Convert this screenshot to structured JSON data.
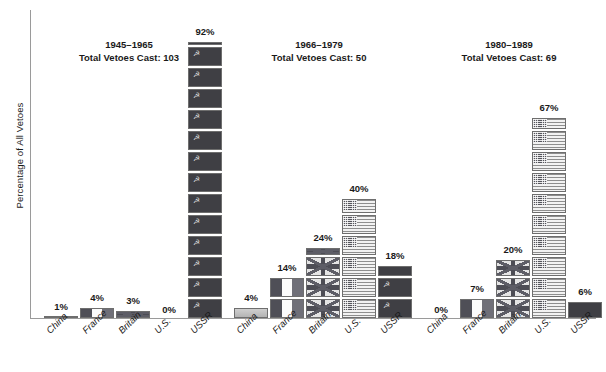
{
  "chart_data": {
    "type": "bar",
    "title": "",
    "xlabel": "",
    "ylabel": "Percentage of All Vetoes",
    "ylim": [
      0,
      100
    ],
    "grid": false,
    "legend": "none",
    "unit_value_percent": 6.5,
    "categories": [
      "China",
      "France",
      "Britain",
      "U.S.",
      "USSR"
    ],
    "groups": [
      {
        "period": "1945–1965",
        "total_label": "Total Vetoes Cast: 103",
        "total_vetoes": 103,
        "values": [
          1,
          4,
          3,
          0,
          92
        ],
        "value_labels": [
          "1%",
          "4%",
          "3%",
          "0%",
          "92%"
        ]
      },
      {
        "period": "1966–1979",
        "total_label": "Total Vetoes Cast: 50",
        "total_vetoes": 50,
        "values": [
          4,
          14,
          24,
          40,
          18
        ],
        "value_labels": [
          "4%",
          "14%",
          "24%",
          "40%",
          "18%"
        ]
      },
      {
        "period": "1980–1989",
        "total_label": "Total Vetoes Cast: 69",
        "total_vetoes": 69,
        "values": [
          0,
          7,
          20,
          67,
          6
        ],
        "value_labels": [
          "0%",
          "7%",
          "20%",
          "67%",
          "6%"
        ]
      }
    ],
    "colors": {
      "ussr": "#3f3f44",
      "usa": "#8e8e8e",
      "britain": "#5d5d66",
      "france": "#4f4f57",
      "china": "#c4c4c4",
      "axis": "#9a9a9a",
      "text": "#1a1a1a"
    }
  },
  "axis": {
    "y_title": "Percentage of All Vetoes"
  }
}
